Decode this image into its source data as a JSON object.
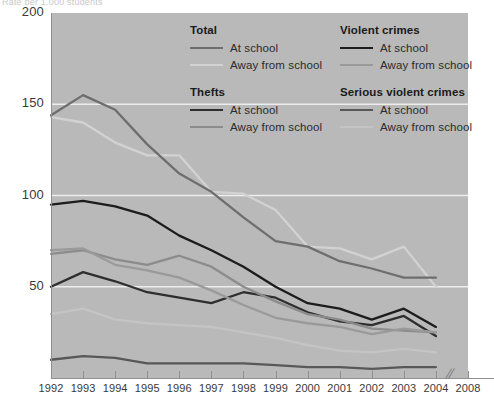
{
  "header": {
    "truncated_title": "Rate per 1,000 students"
  },
  "legend": {
    "groups": [
      {
        "title": "Total",
        "column": "left",
        "entries": [
          {
            "label": "At school",
            "color": "#6e6e6e",
            "width": 2.2
          },
          {
            "label": "Away from school",
            "color": "#d2d2d2",
            "width": 2.0
          }
        ]
      },
      {
        "title": "Thefts",
        "column": "left",
        "entries": [
          {
            "label": "At school",
            "color": "#2e2e2e",
            "width": 2.6
          },
          {
            "label": "Away from school",
            "color": "#8c8c8c",
            "width": 2.0
          }
        ]
      },
      {
        "title": "Violent crimes",
        "column": "right",
        "entries": [
          {
            "label": "At school",
            "color": "#1c1c1c",
            "width": 2.6
          },
          {
            "label": "Away from school",
            "color": "#9a9a9a",
            "width": 2.0
          }
        ]
      },
      {
        "title": "Serious violent crimes",
        "column": "right",
        "entries": [
          {
            "label": "At school",
            "color": "#585858",
            "width": 2.4
          },
          {
            "label": "Away from school",
            "color": "#c4c4c4",
            "width": 2.0
          }
        ]
      }
    ]
  },
  "axes": {
    "y_ticks": [
      "200",
      "150",
      "100",
      "50"
    ],
    "y_tick_values": [
      200,
      150,
      100,
      50
    ],
    "x_ticks": [
      "1992",
      "1993",
      "1994",
      "1995",
      "1996",
      "1997",
      "1998",
      "1999",
      "2000",
      "2001",
      "2002",
      "2003",
      "2004",
      "2008"
    ],
    "axis_break_marker": "//",
    "ylim": [
      0,
      200
    ],
    "grid": "horizontal gridlines at 50, 100, 150"
  },
  "chart_data": {
    "type": "line",
    "title": "Rate per 1,000 students",
    "xlabel": "",
    "ylabel": "Rate per 1,000 students",
    "ylim": [
      0,
      200
    ],
    "grid": true,
    "legend_position": "inside-top-right",
    "x": [
      1992,
      1993,
      1994,
      1995,
      1996,
      1997,
      1998,
      1999,
      2000,
      2001,
      2002,
      2003,
      2004
    ],
    "categories": [
      "1992",
      "1993",
      "1994",
      "1995",
      "1996",
      "1997",
      "1998",
      "1999",
      "2000",
      "2001",
      "2002",
      "2003",
      "2004"
    ],
    "series": [
      {
        "name": "Total — Away from school",
        "group": "Total",
        "location": "Away from school",
        "color": "#d2d2d2",
        "values": [
          143,
          140,
          129,
          122,
          122,
          102,
          101,
          92,
          72,
          71,
          65,
          72,
          50
        ]
      },
      {
        "name": "Total — At school",
        "group": "Total",
        "location": "At school",
        "color": "#6e6e6e",
        "values": [
          144,
          155,
          147,
          128,
          112,
          102,
          88,
          75,
          72,
          64,
          60,
          55,
          55
        ]
      },
      {
        "name": "Violent crimes — At school",
        "group": "Violent crimes",
        "location": "At school",
        "color": "#1c1c1c",
        "values": [
          95,
          97,
          94,
          89,
          78,
          70,
          61,
          50,
          41,
          38,
          32,
          38,
          28
        ]
      },
      {
        "name": "Thefts — At school",
        "group": "Thefts",
        "location": "At school",
        "color": "#2e2e2e",
        "values": [
          50,
          58,
          53,
          47,
          44,
          41,
          47,
          44,
          36,
          31,
          29,
          34,
          23
        ]
      },
      {
        "name": "Thefts — Away from school",
        "group": "Thefts",
        "location": "Away from school",
        "color": "#8c8c8c",
        "values": [
          68,
          70,
          65,
          62,
          67,
          61,
          50,
          42,
          35,
          32,
          27,
          26,
          25
        ]
      },
      {
        "name": "Violent crimes — Away from school",
        "group": "Violent crimes",
        "location": "Away from school",
        "color": "#9a9a9a",
        "values": [
          70,
          71,
          62,
          59,
          55,
          48,
          40,
          33,
          30,
          28,
          24,
          27,
          25
        ]
      },
      {
        "name": "Serious violent crimes — Away from school",
        "group": "Serious violent crimes",
        "location": "Away from school",
        "color": "#c4c4c4",
        "values": [
          35,
          38,
          32,
          30,
          29,
          28,
          25,
          22,
          18,
          15,
          14,
          16,
          14
        ]
      },
      {
        "name": "Serious violent crimes — At school",
        "group": "Serious violent crimes",
        "location": "At school",
        "color": "#585858",
        "values": [
          10,
          12,
          11,
          8,
          8,
          8,
          8,
          7,
          6,
          6,
          5,
          6,
          6
        ]
      }
    ]
  }
}
